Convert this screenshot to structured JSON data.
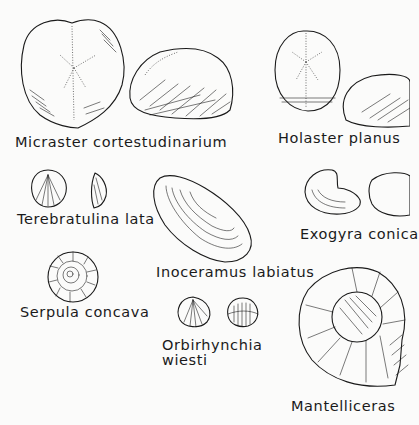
{
  "plate": {
    "background": "#fbfbfa",
    "ink_color": "#1a1a1a",
    "specimens": [
      {
        "id": "micraster",
        "label": "Micraster cortestudinarium"
      },
      {
        "id": "holaster",
        "label": "Holaster planus"
      },
      {
        "id": "terebratulina",
        "label": "Terebratulina lata"
      },
      {
        "id": "exogyra",
        "label": "Exogyra conica"
      },
      {
        "id": "inoceramus",
        "label": "Inoceramus labiatus"
      },
      {
        "id": "serpula",
        "label": "Serpula concava"
      },
      {
        "id": "orbirhynchia",
        "label_line1": "Orbirhynchia",
        "label_line2": "wiesti"
      },
      {
        "id": "mantelliceras",
        "label": "Mantelliceras"
      }
    ]
  }
}
